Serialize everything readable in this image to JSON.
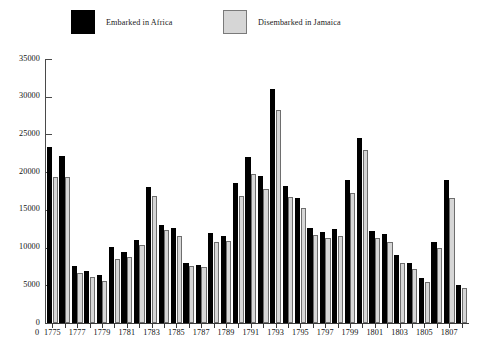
{
  "legend": {
    "entries": [
      {
        "label": "Embarked in Africa",
        "color": "#000000",
        "swatch": "dark"
      },
      {
        "label": "Disembarked in Jamaica",
        "color": "#d6d6d6",
        "swatch": "light"
      }
    ]
  },
  "axes": {
    "y_ticks": [
      "0",
      "5000",
      "10000",
      "15000",
      "20000",
      "25000",
      "30000",
      "35000"
    ],
    "x_ticks": [
      "1775",
      "1777",
      "1779",
      "1781",
      "1783",
      "1785",
      "1787",
      "1789",
      "1791",
      "1793",
      "1795",
      "1797",
      "1799",
      "1801",
      "1803",
      "1805",
      "1807"
    ],
    "y_axis_color": "#4a4a4a",
    "x_axis_color": "#3a3a3a"
  },
  "chart_data": {
    "type": "bar",
    "title": "",
    "subtitle": "",
    "xlabel": "",
    "ylabel": "",
    "ylim": [
      0,
      35000
    ],
    "ytick_step": 5000,
    "grid": false,
    "legend_position": "top",
    "categories": [
      "1775",
      "1776",
      "1777",
      "1778",
      "1779",
      "1780",
      "1781",
      "1782",
      "1783",
      "1784",
      "1785",
      "1786",
      "1787",
      "1788",
      "1789",
      "1790",
      "1791",
      "1792",
      "1793",
      "1794",
      "1795",
      "1796",
      "1797",
      "1798",
      "1799",
      "1800",
      "1801",
      "1802",
      "1803",
      "1804",
      "1805",
      "1806",
      "1807",
      "1808"
    ],
    "series": [
      {
        "name": "Embarked in Africa",
        "color": "#000000",
        "values": [
          23300,
          22100,
          7600,
          6900,
          6400,
          10100,
          9400,
          11000,
          18000,
          13000,
          12600,
          7900,
          7700,
          11900,
          11600,
          18500,
          22000,
          19500,
          31000,
          18200,
          16600,
          12600,
          12100,
          12400,
          19000,
          24500,
          12200,
          11800,
          9000,
          7900,
          6000,
          10800,
          18900,
          5100
        ]
      },
      {
        "name": "Disembarked in Jamaica",
        "color": "#d6d6d6",
        "values": [
          19400,
          19300,
          6600,
          6100,
          5600,
          8500,
          8800,
          10400,
          16800,
          12300,
          11600,
          7500,
          7400,
          10700,
          10900,
          16900,
          19700,
          17800,
          28300,
          16700,
          15200,
          11700,
          11300,
          11500,
          17200,
          23000,
          11300,
          10800,
          8000,
          7200,
          5500,
          9900,
          16600,
          4700
        ]
      }
    ]
  },
  "layout": {
    "plot_left": 45,
    "plot_top": 59,
    "plot_width": 424,
    "plot_height": 264,
    "group_width": 12.4,
    "bar_width": 5.2,
    "bar_gap": 0.4
  }
}
